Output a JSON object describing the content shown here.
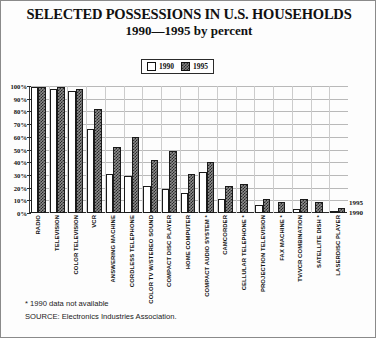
{
  "chart_data": {
    "type": "bar",
    "title": "SELECTED POSSESSIONS IN U.S. HOUSEHOLDS",
    "subtitle": "1990—1995 by percent",
    "xlabel": "",
    "ylabel": "",
    "ylim": [
      0,
      100
    ],
    "grid": true,
    "legend_position": "top-center",
    "ytick_labels": [
      "0%",
      "10%",
      "20%",
      "30%",
      "40%",
      "50%",
      "60%",
      "70%",
      "80%",
      "90%",
      "100%"
    ],
    "ytick_values": [
      0,
      10,
      20,
      30,
      40,
      50,
      60,
      70,
      80,
      90,
      100
    ],
    "categories": [
      "RADIO",
      "TELEVISION",
      "COLOR TELEVISION",
      "VCR",
      "ANSWERING MACHINE",
      "CORDLESS TELEPHONE",
      "COLOR TV W/STEREO SOUND",
      "COMPACT DISC PLAYER",
      "HOME COMPUTER",
      "COMPACT AUDIO SYSTEM  *",
      "CAMCORDER",
      "CELLULAR TELEPHONE *",
      "PROJECTION TELEVISION",
      "FAX MACHINE *",
      "TV/VCR COMBINATION",
      "SATELLITE DISH *",
      "LASERDISC PLAYER"
    ],
    "series": [
      {
        "name": "1990",
        "values": [
          99,
          98,
          96,
          66,
          31,
          29,
          21,
          19,
          16,
          32,
          11,
          null,
          6,
          null,
          3,
          null,
          1
        ]
      },
      {
        "name": "1995",
        "values": [
          99,
          99,
          98,
          82,
          52,
          60,
          42,
          49,
          31,
          40,
          21,
          23,
          11,
          9,
          11,
          9,
          4
        ]
      }
    ],
    "series_callouts": [
      "1995",
      "1990"
    ],
    "annotations": [
      "* 1990 data not available",
      "SOURCE: Electronics Industries Association."
    ],
    "colors": {
      "series_1990_fill": "#ffffff",
      "series_1995_fill": "#8c8c8c",
      "bar_outline": "#1a1a1a",
      "gridline": "#b9b9b9",
      "axis": "#2b2b2b",
      "text": "#111111",
      "background": "#fdfdfd"
    }
  },
  "legend": {
    "items": [
      {
        "label": "1990",
        "swatch": "white-square-swatch"
      },
      {
        "label": "1995",
        "swatch": "hatched-square-swatch"
      }
    ]
  },
  "footnotes": {
    "note_1": "* 1990 data not available",
    "note_2": "SOURCE: Electronics Industries Association."
  }
}
